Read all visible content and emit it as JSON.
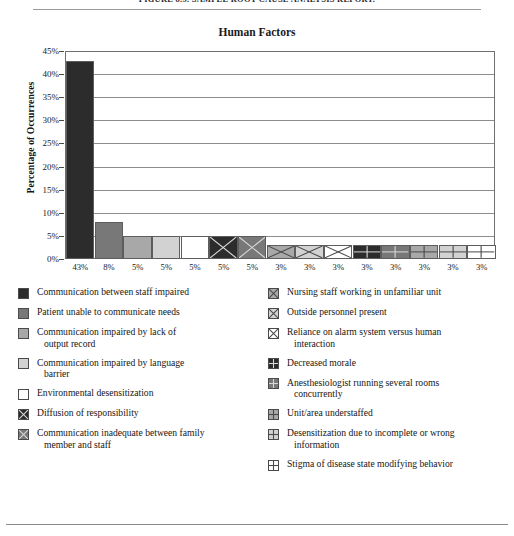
{
  "page": {
    "figure_caption": "FIGURE 8.5. SAMPLE ROOT CAUSE ANALYSIS REPORT."
  },
  "chart_data": {
    "type": "bar",
    "title": "Human Factors",
    "xlabel": "",
    "ylabel": "Percentage of Occurrences",
    "ylim": [
      0,
      45
    ],
    "ytick_labels": [
      "0%",
      "5%",
      "10%",
      "15%",
      "20%",
      "25%",
      "30%",
      "35%",
      "40%",
      "45%"
    ],
    "ytick_values": [
      0,
      5,
      10,
      15,
      20,
      25,
      30,
      35,
      40,
      45
    ],
    "grid": "horizontal",
    "legend_position": "below",
    "categories": [
      "Communication between staff impaired",
      "Patient unable to communicate needs",
      "Communication impaired by lack of output record",
      "Communication impaired by language barrier",
      "Environmental desensitization",
      "Diffusion of responsibility",
      "Communication inadequate between family member and staff",
      "Nursing staff working in unfamiliar unit",
      "Outside personnel present",
      "Reliance on alarm system versus human interaction",
      "Decreased morale",
      "Anesthesiologist running several rooms concurrently",
      "Unit/area understaffed",
      "Desensitization due to incomplete or wrong information",
      "Stigma of disease state modifying behavior"
    ],
    "values": [
      43,
      8,
      5,
      5,
      5,
      5,
      5,
      3,
      3,
      3,
      3,
      3,
      3,
      3,
      3
    ],
    "xtick_labels": [
      "43%",
      "8%",
      "5%",
      "5%",
      "5%",
      "5%",
      "5%",
      "3%",
      "3%",
      "3%",
      "3%",
      "3%",
      "3%",
      "3%",
      "3%"
    ]
  },
  "legend": {
    "left_column": [
      {
        "label": "Communication between staff impaired",
        "cont": "",
        "fill": "#2c2c2c",
        "pattern": "solid"
      },
      {
        "label": "Patient unable to communicate needs",
        "cont": "",
        "fill": "#787878",
        "pattern": "solid"
      },
      {
        "label": "Communication impaired by lack of",
        "cont": "output record",
        "fill": "#a8a8a8",
        "pattern": "solid"
      },
      {
        "label": "Communication impaired by language",
        "cont": "barrier",
        "fill": "#d2d2d2",
        "pattern": "solid"
      },
      {
        "label": "Environmental desensitization",
        "cont": "",
        "fill": "#ffffff",
        "pattern": "solid"
      },
      {
        "label": "Diffusion of responsibility",
        "cont": "",
        "fill": "#2c2c2c",
        "pattern": "cross"
      },
      {
        "label": "Communication inadequate between family",
        "cont": "member and staff",
        "fill": "#787878",
        "pattern": "cross"
      }
    ],
    "right_column": [
      {
        "label": "Nursing staff working in unfamiliar unit",
        "cont": "",
        "fill": "#a8a8a8",
        "pattern": "cross"
      },
      {
        "label": "Outside personnel present",
        "cont": "",
        "fill": "#d2d2d2",
        "pattern": "cross"
      },
      {
        "label": "Reliance on alarm system versus human",
        "cont": "interaction",
        "fill": "#ffffff",
        "pattern": "cross"
      },
      {
        "label": "Decreased morale",
        "cont": "",
        "fill": "#2c2c2c",
        "pattern": "grid"
      },
      {
        "label": "Anesthesiologist running several rooms",
        "cont": "concurrently",
        "fill": "#787878",
        "pattern": "grid"
      },
      {
        "label": "Unit/area understaffed",
        "cont": "",
        "fill": "#a8a8a8",
        "pattern": "grid"
      },
      {
        "label": "Desensitization due to incomplete or wrong",
        "cont": "information",
        "fill": "#d2d2d2",
        "pattern": "grid"
      },
      {
        "label": "Stigma of disease state modifying behavior",
        "cont": "",
        "fill": "#ffffff",
        "pattern": "grid"
      }
    ]
  },
  "bar_styles": [
    {
      "fill": "#2c2c2c",
      "pattern": "solid"
    },
    {
      "fill": "#787878",
      "pattern": "solid"
    },
    {
      "fill": "#a8a8a8",
      "pattern": "solid"
    },
    {
      "fill": "#d2d2d2",
      "pattern": "solid"
    },
    {
      "fill": "#ffffff",
      "pattern": "solid"
    },
    {
      "fill": "#2c2c2c",
      "pattern": "cross"
    },
    {
      "fill": "#787878",
      "pattern": "cross"
    },
    {
      "fill": "#a8a8a8",
      "pattern": "cross"
    },
    {
      "fill": "#d2d2d2",
      "pattern": "cross"
    },
    {
      "fill": "#ffffff",
      "pattern": "cross"
    },
    {
      "fill": "#2c2c2c",
      "pattern": "grid"
    },
    {
      "fill": "#787878",
      "pattern": "grid"
    },
    {
      "fill": "#a8a8a8",
      "pattern": "grid"
    },
    {
      "fill": "#d2d2d2",
      "pattern": "grid"
    },
    {
      "fill": "#ffffff",
      "pattern": "grid"
    }
  ]
}
